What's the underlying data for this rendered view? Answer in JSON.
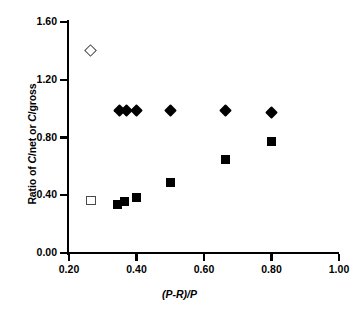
{
  "chart_data": {
    "type": "scatter",
    "title": "",
    "xlabel": "(P-R)/P",
    "ylabel": "Ratio of C/net or C/gross",
    "xlim": [
      0.2,
      1.0
    ],
    "ylim": [
      0.0,
      1.6
    ],
    "xticks": [
      "0.20",
      "0.40",
      "0.60",
      "0.80",
      "1.00"
    ],
    "xtick_values": [
      0.2,
      0.4,
      0.6,
      0.8,
      1.0
    ],
    "yticks": [
      "0.00",
      "0.40",
      "0.80",
      "1.20",
      "1.60"
    ],
    "ytick_values": [
      0.0,
      0.4,
      0.8,
      1.2,
      1.6
    ],
    "grid": false,
    "legend": "none",
    "series": [
      {
        "name": "C/net",
        "marker": "diamond-filled",
        "color": "#000000",
        "points": [
          {
            "x": 0.35,
            "y": 0.99
          },
          {
            "x": 0.37,
            "y": 0.99
          },
          {
            "x": 0.4,
            "y": 0.99
          },
          {
            "x": 0.5,
            "y": 0.99
          },
          {
            "x": 0.665,
            "y": 0.985
          },
          {
            "x": 0.8,
            "y": 0.975
          }
        ]
      },
      {
        "name": "C/gross",
        "marker": "square-filled",
        "color": "#000000",
        "points": [
          {
            "x": 0.345,
            "y": 0.335
          },
          {
            "x": 0.365,
            "y": 0.36
          },
          {
            "x": 0.4,
            "y": 0.385
          },
          {
            "x": 0.5,
            "y": 0.49
          },
          {
            "x": 0.665,
            "y": 0.645
          },
          {
            "x": 0.8,
            "y": 0.775
          }
        ]
      },
      {
        "name": "C/net outlier",
        "marker": "diamond-open",
        "color": "#4a4a4a",
        "points": [
          {
            "x": 0.265,
            "y": 1.4
          }
        ]
      },
      {
        "name": "C/gross outlier",
        "marker": "square-open",
        "color": "#4a4a4a",
        "points": [
          {
            "x": 0.265,
            "y": 0.365
          }
        ]
      }
    ]
  },
  "axis_titles": {
    "y_prefix": "Ratio of ",
    "y_c1": "C",
    "y_mid": "/net or ",
    "y_c2": "C",
    "y_suffix": "/gross",
    "x_open": "(",
    "x_p1": "P",
    "x_dash": "-",
    "x_r": "R",
    "x_close": ")/",
    "x_p2": "P"
  }
}
